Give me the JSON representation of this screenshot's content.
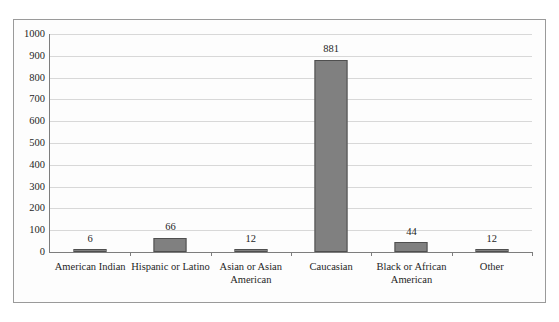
{
  "chart_data": {
    "type": "bar",
    "title": "",
    "subtitle": "",
    "xlabel": "",
    "ylabel": "",
    "ylim": [
      0,
      1000
    ],
    "ytick_step": 100,
    "yticks": [
      0,
      100,
      200,
      300,
      400,
      500,
      600,
      700,
      800,
      900,
      1000
    ],
    "ytick_labels": [
      "0",
      "100",
      "200",
      "300",
      "400",
      "500",
      "600",
      "700",
      "800",
      "900",
      "1000"
    ],
    "grid": true,
    "grid_axis": "y",
    "legend": false,
    "legend_position": "none",
    "data_labels": true,
    "categories": [
      "American Indian",
      "Hispanic or Latino",
      "Asian or Asian American",
      "Caucasian",
      "Black or African American",
      "Other"
    ],
    "category_label_lines": [
      [
        "American Indian"
      ],
      [
        "Hispanic or Latino"
      ],
      [
        "Asian or Asian",
        "American"
      ],
      [
        "Caucasian"
      ],
      [
        "Black or African",
        "American"
      ],
      [
        "Other"
      ]
    ],
    "values": [
      6,
      66,
      12,
      881,
      44,
      12
    ],
    "value_labels": [
      "6",
      "66",
      "12",
      "881",
      "44",
      "12"
    ],
    "bar_color": "#808080",
    "bar_border_color": "#4f4f4f",
    "gridline_color": "#d8d8d8",
    "axis_color": "#7d7d7d",
    "frame_border_color": "#9a9a9a",
    "background_color": "#fdfdfd",
    "text_color": "#1f1f1f"
  }
}
